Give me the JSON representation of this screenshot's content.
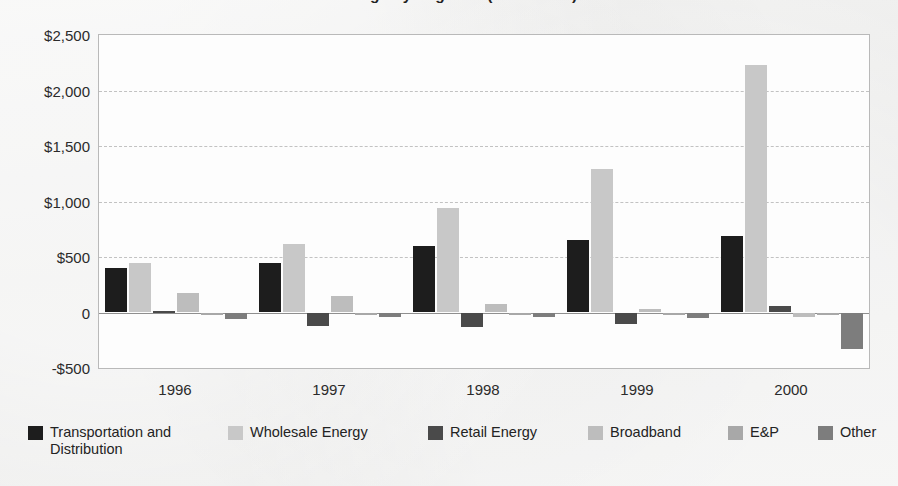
{
  "chart_title": "Earnings by Segment (1996–2000)",
  "chart_data": {
    "type": "bar",
    "title": "Earnings by Segment (1996–2000)",
    "xlabel": "",
    "ylabel": "",
    "ylim": [
      -500,
      2500
    ],
    "ytick_labels": [
      "$2,500",
      "$2,000",
      "$1,500",
      "$1,000",
      "$500",
      "0",
      "-$500"
    ],
    "ytick_values": [
      2500,
      2000,
      1500,
      1000,
      500,
      0,
      -500
    ],
    "grid": true,
    "legend_position": "bottom",
    "categories": [
      "1996",
      "1997",
      "1998",
      "1999",
      "2000"
    ],
    "series": [
      {
        "name": "Transportation and Distribution",
        "color": "#1d1d1d",
        "values": [
          400,
          450,
          600,
          650,
          690
        ]
      },
      {
        "name": "Wholesale Energy",
        "color": "#c8c8c8",
        "values": [
          450,
          620,
          940,
          1290,
          2230
        ]
      },
      {
        "name": "Retail Energy",
        "color": "#4a4a4a",
        "values": [
          15,
          -120,
          -130,
          -100,
          60
        ]
      },
      {
        "name": "Broadband",
        "color": "#bdbdbd",
        "values": [
          175,
          150,
          80,
          30,
          -40
        ]
      },
      {
        "name": "E&P",
        "color": "#a8a8a8",
        "values": [
          -10,
          -20,
          -15,
          -15,
          -10
        ]
      },
      {
        "name": "Other",
        "color": "#7d7d7d",
        "values": [
          -55,
          -45,
          -40,
          -50,
          -330
        ]
      }
    ]
  },
  "legend": {
    "items": [
      {
        "label": "Transportation and Distribution",
        "color": "#1d1d1d",
        "left": 0,
        "width": 160
      },
      {
        "label": "Wholesale Energy",
        "color": "#c8c8c8",
        "left": 200,
        "width": 170
      },
      {
        "label": "Retail Energy",
        "color": "#4a4a4a",
        "left": 400,
        "width": 130
      },
      {
        "label": "Broadband",
        "color": "#bdbdbd",
        "left": 560,
        "width": 120
      },
      {
        "label": "E&P",
        "color": "#a8a8a8",
        "left": 700,
        "width": 60
      },
      {
        "label": "Other",
        "color": "#7d7d7d",
        "left": 790,
        "width": 70
      }
    ]
  }
}
